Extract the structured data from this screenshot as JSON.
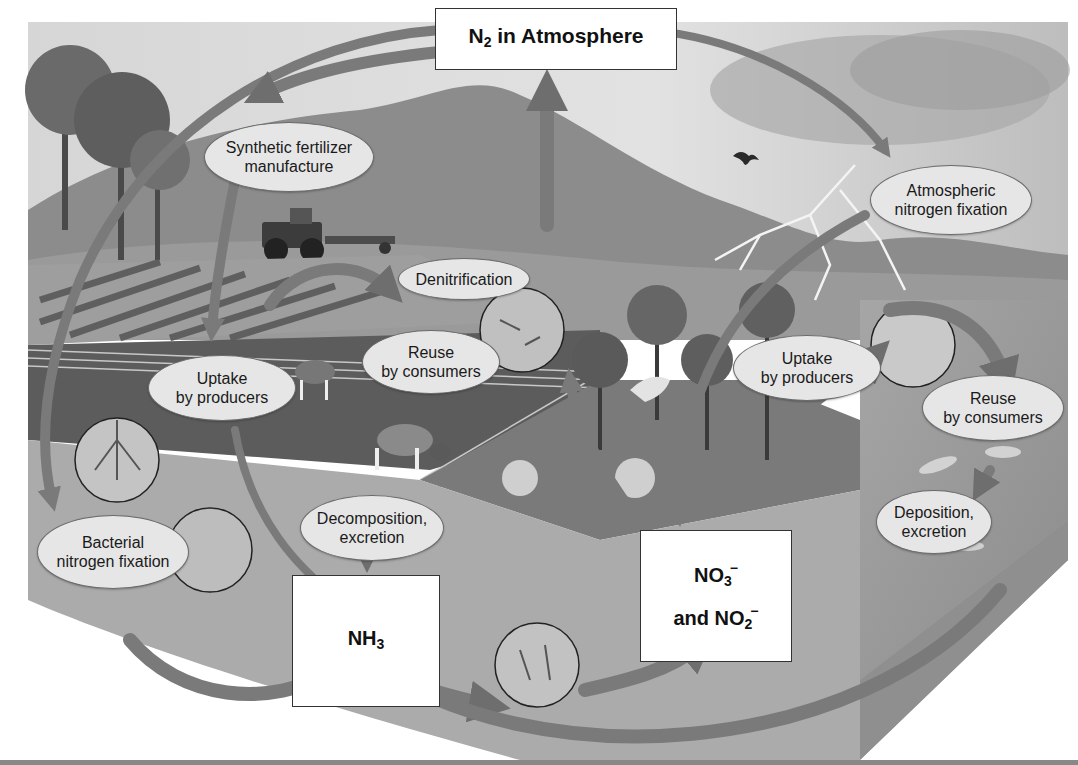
{
  "diagram": {
    "title_box": {
      "main": "N",
      "sub": "2",
      "rest": " in Atmosphere"
    },
    "boxes": {
      "ammonia": {
        "main": "NH",
        "sub": "3"
      },
      "nitrate_nitrite": {
        "line1": {
          "main": "NO",
          "sub": "3",
          "sup": "−"
        },
        "line2": {
          "prefix": "and NO",
          "sub": "2",
          "sup": "−"
        }
      }
    },
    "process_labels": [
      {
        "id": "synthetic-fertilizer",
        "lines": [
          "Synthetic fertilizer",
          "manufacture"
        ]
      },
      {
        "id": "atmospheric-fixation",
        "lines": [
          "Atmospheric",
          "nitrogen fixation"
        ]
      },
      {
        "id": "denitrification",
        "lines": [
          "Denitrification"
        ]
      },
      {
        "id": "reuse-consumers-land",
        "lines": [
          "Reuse",
          "by consumers"
        ]
      },
      {
        "id": "uptake-producers-land",
        "lines": [
          "Uptake",
          "by producers"
        ]
      },
      {
        "id": "uptake-producers-water",
        "lines": [
          "Uptake",
          "by producers"
        ]
      },
      {
        "id": "reuse-consumers-water",
        "lines": [
          "Reuse",
          "by consumers"
        ]
      },
      {
        "id": "deposition-excretion",
        "lines": [
          "Deposition,",
          "excretion"
        ]
      },
      {
        "id": "decomposition-excretion",
        "lines": [
          "Decomposition,",
          "excretion"
        ]
      },
      {
        "id": "bacterial-fixation",
        "lines": [
          "Bacterial",
          "nitrogen fixation"
        ]
      }
    ],
    "colors": {
      "sky": "#d9d9d9",
      "mountain": "#8a8a8a",
      "field": "#5a5a5a",
      "soil": "#a8a8a8",
      "water": "#9a9a9a",
      "arrow": "#7a7a7a",
      "label_fill": "#e6e6e6",
      "box_fill": "#ffffff"
    }
  }
}
